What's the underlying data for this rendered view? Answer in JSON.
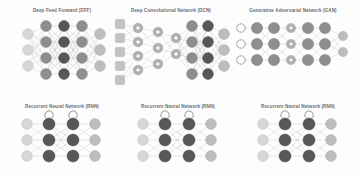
{
  "page": {
    "background_color": "#fdfdfd",
    "title_color": "#6d6d6d",
    "layout": "3 columns x 2 rows of neural network architecture diagrams"
  },
  "panels": [
    {
      "id": "dff",
      "title": "Deep Feed Forward (DFF)",
      "diagram_name": "deep-feed-forward-diagram",
      "layers": [
        {
          "role": "input",
          "count": 3,
          "style": "n-input"
        },
        {
          "role": "hidden",
          "count": 4,
          "style": "n-hidden"
        },
        {
          "role": "hidden",
          "count": 4,
          "style": "n-dark"
        },
        {
          "role": "hidden",
          "count": 4,
          "style": "n-hidden"
        },
        {
          "role": "output",
          "count": 3,
          "style": "n-out"
        }
      ]
    },
    {
      "id": "dcn",
      "title": "Deep Convolutional Network (DCN)",
      "diagram_name": "deep-convolutional-network-diagram",
      "layers": [
        {
          "role": "input",
          "count": 5,
          "style": "n-square"
        },
        {
          "role": "conv",
          "count": 4,
          "style": "n-kernel"
        },
        {
          "role": "conv",
          "count": 3,
          "style": "n-kernel"
        },
        {
          "role": "dense",
          "count": 4,
          "style": "n-hidden"
        },
        {
          "role": "dense",
          "count": 4,
          "style": "n-dark"
        },
        {
          "role": "output",
          "count": 3,
          "style": "n-out"
        }
      ]
    },
    {
      "id": "gan",
      "title": "Generative Adversarial Network (GAN)",
      "diagram_name": "generative-adversarial-network-diagram",
      "layers": [
        {
          "role": "input",
          "count": 3,
          "style": "n-hollow"
        },
        {
          "role": "hidden",
          "count": 3,
          "style": "n-hidden"
        },
        {
          "role": "hidden",
          "count": 3,
          "style": "n-hidden"
        },
        {
          "role": "match",
          "count": 3,
          "style": "n-kernel"
        },
        {
          "role": "hidden",
          "count": 3,
          "style": "n-hidden"
        },
        {
          "role": "hidden",
          "count": 3,
          "style": "n-hidden"
        },
        {
          "role": "output",
          "count": 2,
          "style": "n-out"
        }
      ]
    },
    {
      "id": "rnn1",
      "title": "Recurrent Neural Network (RNN)",
      "diagram_name": "recurrent-neural-network-diagram-1",
      "layers": [
        {
          "role": "input",
          "count": 3,
          "style": "n-input"
        },
        {
          "role": "recurrent",
          "count": 3,
          "style": "n-dark"
        },
        {
          "role": "recurrent",
          "count": 3,
          "style": "n-dark"
        },
        {
          "role": "output",
          "count": 3,
          "style": "n-out"
        }
      ]
    },
    {
      "id": "rnn2",
      "title": "Recurrent Neural Network (RNN)",
      "diagram_name": "recurrent-neural-network-diagram-2",
      "layers": [
        {
          "role": "input",
          "count": 3,
          "style": "n-input"
        },
        {
          "role": "recurrent",
          "count": 3,
          "style": "n-dark"
        },
        {
          "role": "recurrent",
          "count": 3,
          "style": "n-dark"
        },
        {
          "role": "output",
          "count": 3,
          "style": "n-out"
        }
      ]
    },
    {
      "id": "rnn3",
      "title": "Recurrent Neural Network (RNN)",
      "diagram_name": "recurrent-neural-network-diagram-3",
      "layers": [
        {
          "role": "input",
          "count": 3,
          "style": "n-input"
        },
        {
          "role": "recurrent",
          "count": 3,
          "style": "n-dark"
        },
        {
          "role": "recurrent",
          "count": 3,
          "style": "n-dark"
        },
        {
          "role": "output",
          "count": 3,
          "style": "n-out"
        }
      ]
    }
  ]
}
